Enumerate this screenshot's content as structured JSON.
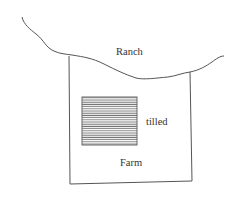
{
  "diagram": {
    "type": "land-use sketch",
    "labels": {
      "ranch": "Ranch",
      "tilled": "tilled",
      "farm": "Farm"
    },
    "regions": [
      {
        "name": "Ranch",
        "description": "area above the wavy boundary line"
      },
      {
        "name": "Farm",
        "description": "rectangular plot below the boundary"
      },
      {
        "name": "tilled",
        "description": "horizontally hatched square inside the farm"
      }
    ],
    "colors": {
      "line": "#555555",
      "hatch": "#777777",
      "text": "#333333",
      "background": "#ffffff"
    }
  }
}
